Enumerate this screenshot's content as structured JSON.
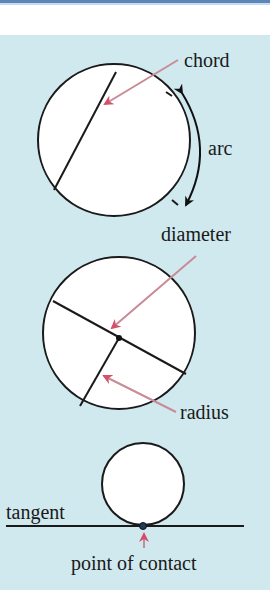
{
  "diagram": {
    "colors": {
      "background_panel": "#cfe9ee",
      "header_rule": "#5b86b8",
      "arrow": "#d4506a",
      "line": "#1a1a1a",
      "circle_fill": "#ffffff"
    },
    "circle1": {
      "labels": {
        "chord": "chord",
        "arc": "arc"
      }
    },
    "circle2": {
      "labels": {
        "diameter": "diameter",
        "radius": "radius"
      }
    },
    "circle3": {
      "labels": {
        "tangent": "tangent",
        "point_of_contact": "point of contact"
      }
    }
  }
}
